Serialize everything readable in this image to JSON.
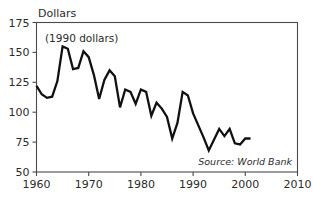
{
  "chart_data": {
    "type": "line",
    "title": "",
    "subtitle": "",
    "xlabel": "",
    "ylabel": "Dollars",
    "annotation": "(1990 dollars)",
    "source": "Source: World Bank",
    "grid": false,
    "legend_position": "none",
    "xlim": [
      1960,
      2010
    ],
    "ylim": [
      50,
      175
    ],
    "xticks": [
      1960,
      1970,
      1980,
      1990,
      2000,
      2010
    ],
    "xtick_labels": [
      "1960",
      "1970",
      "1980",
      "1990",
      "2000",
      "2010"
    ],
    "yticks": [
      50,
      75,
      100,
      125,
      150,
      175
    ],
    "ytick_labels": [
      "50",
      "75",
      "100",
      "125",
      "150",
      "175"
    ],
    "series": [
      {
        "name": "Commodity price index",
        "x": [
          1960,
          1961,
          1962,
          1963,
          1964,
          1965,
          1966,
          1967,
          1968,
          1969,
          1970,
          1971,
          1972,
          1973,
          1974,
          1975,
          1976,
          1977,
          1978,
          1979,
          1980,
          1981,
          1982,
          1983,
          1984,
          1985,
          1986,
          1987,
          1988,
          1989,
          1990,
          1991,
          1992,
          1993,
          1994,
          1995,
          1996,
          1997,
          1998,
          1999,
          2000,
          2001
        ],
        "values": [
          122,
          115,
          112,
          113,
          126,
          155,
          153,
          136,
          137,
          151,
          146,
          131,
          111,
          127,
          135,
          130,
          104,
          119,
          117,
          107,
          119,
          117,
          97,
          108,
          103,
          96,
          78,
          91,
          117,
          114,
          99,
          89,
          79,
          68,
          77,
          86,
          80,
          86,
          74,
          73,
          78,
          78
        ]
      }
    ]
  },
  "axis_title": {
    "y": "Dollars"
  },
  "labels": {
    "annotation": "(1990 dollars)",
    "source": "Source: World Bank"
  }
}
